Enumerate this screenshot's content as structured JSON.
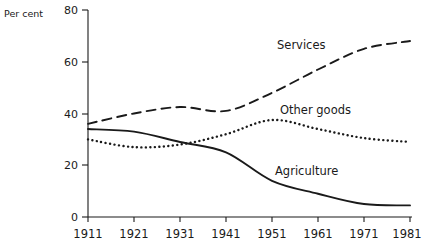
{
  "chart_data": {
    "type": "line",
    "title": "",
    "subtitle": "",
    "xlabel": "",
    "ylabel": "Per cent",
    "xlim": [
      1911,
      1981
    ],
    "ylim": [
      0,
      80
    ],
    "grid": false,
    "legend_position": "inline-annotations",
    "x_tick_labels": [
      "1911",
      "1921",
      "1931",
      "1941",
      "1951",
      "1961",
      "1971",
      "1981"
    ],
    "y_tick_labels": [
      "0",
      "20",
      "40",
      "60",
      "80"
    ],
    "x": [
      1911,
      1921,
      1931,
      1941,
      1951,
      1961,
      1971,
      1981
    ],
    "series": [
      {
        "name": "Services",
        "style": "dashed",
        "color": "#1a1a1a",
        "values": [
          36,
          40,
          42.5,
          41,
          48,
          57,
          65,
          68
        ],
        "annotation": "Services"
      },
      {
        "name": "Other goods",
        "style": "dotted",
        "color": "#1a1a1a",
        "values": [
          30,
          27,
          28,
          32,
          37.5,
          34,
          30.5,
          29
        ],
        "annotation": "Other goods"
      },
      {
        "name": "Agriculture",
        "style": "solid",
        "color": "#1a1a1a",
        "values": [
          34,
          33,
          29,
          25,
          14,
          9,
          5,
          4.5
        ],
        "annotation": "Agriculture"
      }
    ]
  },
  "axis": {
    "y_label": "Per cent",
    "y_ticks": [
      "80",
      "60",
      "40",
      "20",
      "0"
    ],
    "x_ticks": [
      "1911",
      "1921",
      "1931",
      "1941",
      "1951",
      "1961",
      "1971",
      "1981"
    ]
  },
  "annotations": {
    "services": "Services",
    "other_goods": "Other goods",
    "agriculture": "Agriculture"
  },
  "colors": {
    "ink": "#1a1a1a",
    "background": "#ffffff"
  }
}
